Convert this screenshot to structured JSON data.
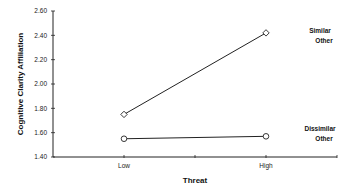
{
  "chart_data": {
    "type": "line",
    "title": "",
    "xlabel": "Threat",
    "ylabel": "Cognitive Clarity Affiliation",
    "categories": [
      "Low",
      "High"
    ],
    "ylim": [
      1.4,
      2.6
    ],
    "yticks": [
      "2.60",
      "2.40",
      "2.20",
      "2.00",
      "1.80",
      "1.60",
      "1.40"
    ],
    "grid": false,
    "legend_position": "right, inline labels",
    "series": [
      {
        "name": "Similar Other",
        "label_lines": [
          "Similar",
          "Other"
        ],
        "marker": "diamond",
        "values": [
          1.75,
          2.42
        ]
      },
      {
        "name": "Dissimilar Other",
        "label_lines": [
          "Dissimilar",
          "Other"
        ],
        "marker": "circle",
        "values": [
          1.55,
          1.57
        ]
      }
    ]
  },
  "colors": {
    "line": "#222222",
    "marker_fill": "#ffffff",
    "axis": "#222222"
  }
}
